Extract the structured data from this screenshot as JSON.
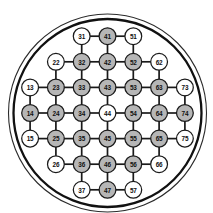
{
  "diagram": {
    "type": "node-grid",
    "geometry": {
      "width": 213,
      "height": 213,
      "center_x": 107.5,
      "center_y": 113,
      "outer_circle_radius": 99,
      "inner_circle_radius": 94,
      "column_spacing": 25.8,
      "row_spacing": 25.6,
      "node_radius": 8.4
    },
    "colors": {
      "background": "#ffffff",
      "node_fill_active": "#b6b6b6",
      "node_fill_inactive": "#ffffff",
      "node_stroke": "#1a1a1a",
      "edge_stroke": "#1a1a1a",
      "label_text": "#111111",
      "wafer_outer_stroke": "#2b2b2b",
      "wafer_inner_stroke": "#111111"
    },
    "legend": {
      "filled_meaning": "filled",
      "hollow_meaning": "hollow"
    },
    "counts": {
      "total_nodes": 37,
      "filled_nodes": 20,
      "hollow_nodes": 17
    },
    "nodes": [
      {
        "label": "31",
        "col": 3,
        "row": 1,
        "filled": false
      },
      {
        "label": "41",
        "col": 4,
        "row": 1,
        "filled": true
      },
      {
        "label": "51",
        "col": 5,
        "row": 1,
        "filled": false
      },
      {
        "label": "22",
        "col": 2,
        "row": 2,
        "filled": false
      },
      {
        "label": "32",
        "col": 3,
        "row": 2,
        "filled": true
      },
      {
        "label": "42",
        "col": 4,
        "row": 2,
        "filled": true
      },
      {
        "label": "52",
        "col": 5,
        "row": 2,
        "filled": true
      },
      {
        "label": "62",
        "col": 6,
        "row": 2,
        "filled": false
      },
      {
        "label": "13",
        "col": 1,
        "row": 3,
        "filled": false
      },
      {
        "label": "23",
        "col": 2,
        "row": 3,
        "filled": true
      },
      {
        "label": "33",
        "col": 3,
        "row": 3,
        "filled": true
      },
      {
        "label": "43",
        "col": 4,
        "row": 3,
        "filled": true
      },
      {
        "label": "53",
        "col": 5,
        "row": 3,
        "filled": true
      },
      {
        "label": "63",
        "col": 6,
        "row": 3,
        "filled": true
      },
      {
        "label": "73",
        "col": 7,
        "row": 3,
        "filled": false
      },
      {
        "label": "14",
        "col": 1,
        "row": 4,
        "filled": true
      },
      {
        "label": "24",
        "col": 2,
        "row": 4,
        "filled": true
      },
      {
        "label": "34",
        "col": 3,
        "row": 4,
        "filled": true
      },
      {
        "label": "44",
        "col": 4,
        "row": 4,
        "filled": false
      },
      {
        "label": "54",
        "col": 5,
        "row": 4,
        "filled": true
      },
      {
        "label": "64",
        "col": 6,
        "row": 4,
        "filled": true
      },
      {
        "label": "74",
        "col": 7,
        "row": 4,
        "filled": true
      },
      {
        "label": "15",
        "col": 1,
        "row": 5,
        "filled": false
      },
      {
        "label": "25",
        "col": 2,
        "row": 5,
        "filled": true
      },
      {
        "label": "35",
        "col": 3,
        "row": 5,
        "filled": true
      },
      {
        "label": "45",
        "col": 4,
        "row": 5,
        "filled": true
      },
      {
        "label": "55",
        "col": 5,
        "row": 5,
        "filled": true
      },
      {
        "label": "65",
        "col": 6,
        "row": 5,
        "filled": true
      },
      {
        "label": "75",
        "col": 7,
        "row": 5,
        "filled": false
      },
      {
        "label": "26",
        "col": 2,
        "row": 6,
        "filled": false
      },
      {
        "label": "36",
        "col": 3,
        "row": 6,
        "filled": true
      },
      {
        "label": "46",
        "col": 4,
        "row": 6,
        "filled": true
      },
      {
        "label": "56",
        "col": 5,
        "row": 6,
        "filled": true
      },
      {
        "label": "66",
        "col": 6,
        "row": 6,
        "filled": false
      },
      {
        "label": "37",
        "col": 3,
        "row": 7,
        "filled": false
      },
      {
        "label": "47",
        "col": 4,
        "row": 7,
        "filled": true
      },
      {
        "label": "57",
        "col": 5,
        "row": 7,
        "filled": false
      }
    ],
    "edges": [
      [
        "31",
        "41"
      ],
      [
        "41",
        "51"
      ],
      [
        "22",
        "32"
      ],
      [
        "32",
        "42"
      ],
      [
        "42",
        "52"
      ],
      [
        "52",
        "62"
      ],
      [
        "13",
        "23"
      ],
      [
        "23",
        "33"
      ],
      [
        "33",
        "43"
      ],
      [
        "43",
        "53"
      ],
      [
        "53",
        "63"
      ],
      [
        "63",
        "73"
      ],
      [
        "14",
        "24"
      ],
      [
        "24",
        "34"
      ],
      [
        "34",
        "44"
      ],
      [
        "44",
        "54"
      ],
      [
        "54",
        "64"
      ],
      [
        "64",
        "74"
      ],
      [
        "15",
        "25"
      ],
      [
        "25",
        "35"
      ],
      [
        "35",
        "45"
      ],
      [
        "45",
        "55"
      ],
      [
        "55",
        "65"
      ],
      [
        "65",
        "75"
      ],
      [
        "26",
        "36"
      ],
      [
        "36",
        "46"
      ],
      [
        "46",
        "56"
      ],
      [
        "56",
        "66"
      ],
      [
        "37",
        "47"
      ],
      [
        "47",
        "57"
      ],
      [
        "31",
        "32"
      ],
      [
        "32",
        "33"
      ],
      [
        "33",
        "34"
      ],
      [
        "34",
        "35"
      ],
      [
        "35",
        "36"
      ],
      [
        "36",
        "37"
      ],
      [
        "41",
        "42"
      ],
      [
        "42",
        "43"
      ],
      [
        "43",
        "44"
      ],
      [
        "44",
        "45"
      ],
      [
        "45",
        "46"
      ],
      [
        "46",
        "47"
      ],
      [
        "51",
        "52"
      ],
      [
        "52",
        "53"
      ],
      [
        "53",
        "54"
      ],
      [
        "54",
        "55"
      ],
      [
        "55",
        "56"
      ],
      [
        "56",
        "57"
      ],
      [
        "22",
        "23"
      ],
      [
        "23",
        "24"
      ],
      [
        "24",
        "25"
      ],
      [
        "25",
        "26"
      ],
      [
        "62",
        "63"
      ],
      [
        "63",
        "64"
      ],
      [
        "64",
        "65"
      ],
      [
        "65",
        "66"
      ],
      [
        "13",
        "14"
      ],
      [
        "14",
        "15"
      ],
      [
        "73",
        "74"
      ],
      [
        "74",
        "75"
      ]
    ]
  }
}
